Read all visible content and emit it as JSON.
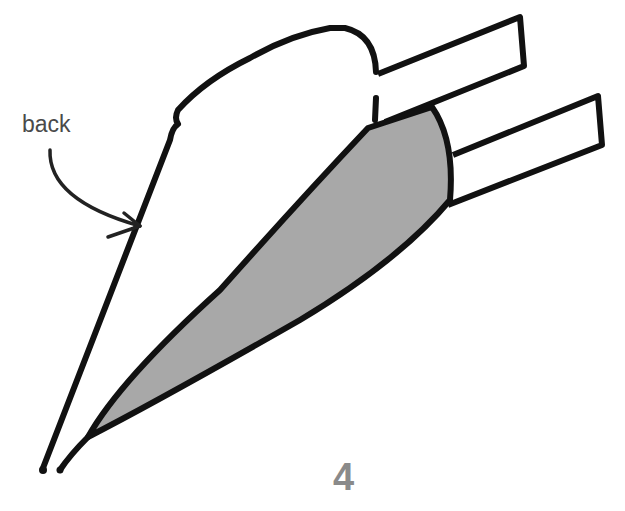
{
  "diagram": {
    "annotation": {
      "label": "back",
      "target": "back edge of shape"
    },
    "step_number": "4",
    "colors": {
      "stroke": "#111111",
      "fill_shaded": "#a8a8a8",
      "label_text": "#4a4a4a",
      "step_text": "#8a8a8a"
    }
  }
}
